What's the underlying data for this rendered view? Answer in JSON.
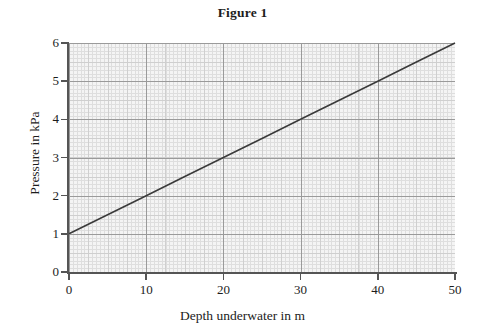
{
  "chart_data": {
    "type": "line",
    "title": "Figure 1",
    "xlabel": "Depth underwater in m",
    "ylabel": "Pressure in kPa",
    "xlim": [
      0,
      50
    ],
    "ylim": [
      0,
      6
    ],
    "xticks": [
      "0",
      "10",
      "20",
      "30",
      "40",
      "50"
    ],
    "xtick_values": [
      0,
      10,
      20,
      30,
      40,
      50
    ],
    "yticks": [
      "0",
      "1",
      "2",
      "3",
      "4",
      "5",
      "6"
    ],
    "ytick_values": [
      0,
      1,
      2,
      3,
      4,
      5,
      6
    ],
    "grid": true,
    "grid_style": "graph-paper minor gridlines",
    "legend": "none",
    "series": [
      {
        "name": "Pressure vs depth",
        "color": "#3a3a3a",
        "relation": "Pressure = 1 + 0.1 x Depth",
        "x": [
          0,
          5,
          10,
          15,
          20,
          25,
          30,
          35,
          40,
          45,
          50
        ],
        "values": [
          1,
          1.5,
          2,
          2.5,
          3,
          3.5,
          4,
          4.5,
          5,
          5.5,
          6
        ]
      }
    ]
  },
  "colors": {
    "plot_background": "#f4f4f4",
    "axis": "#555555",
    "grid_major": "#9a9a9a",
    "grid_minor": "#dedede",
    "line": "#3a3a3a",
    "text": "#1c1c1c"
  }
}
